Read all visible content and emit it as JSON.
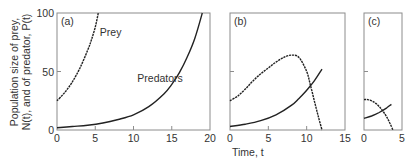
{
  "chart_data": {
    "type": "line",
    "ylabel_line1": "Population size of prey,",
    "ylabel_line2": "N(t), and of predator, P(t)",
    "xlabel": "Time, t",
    "ylim": [
      0,
      100
    ],
    "yticks": [
      0,
      50,
      100
    ],
    "panels": [
      {
        "label": "(a)",
        "xlim": [
          0,
          20
        ],
        "xticks": [
          0,
          5,
          10,
          15,
          20
        ],
        "annotations": [
          {
            "text": "Prey",
            "x": 5.6,
            "y": 80
          },
          {
            "text": "Predators",
            "x": 10.5,
            "y": 41
          }
        ],
        "series": [
          {
            "name": "Prey",
            "style": "dashed",
            "x": [
              0,
              1,
              2,
              3,
              4,
              4.5,
              5,
              5.4
            ],
            "y": [
              25,
              32,
              41,
              53,
              68,
              77,
              88,
              100
            ]
          },
          {
            "name": "Predators",
            "style": "solid",
            "x": [
              0,
              2,
              4,
              6,
              8,
              10,
              12,
              14,
              15,
              16,
              17,
              18,
              19
            ],
            "y": [
              2,
              3,
              4,
              6,
              9,
              13,
              20,
              31,
              39,
              49,
              62,
              78,
              100
            ]
          }
        ]
      },
      {
        "label": "(b)",
        "xlim": [
          0,
          15
        ],
        "xticks": [
          0,
          5,
          10,
          15
        ],
        "series": [
          {
            "name": "Prey",
            "style": "dashed",
            "x": [
              0,
              1,
              2,
              3,
              4,
              5,
              6,
              7,
              8,
              9,
              10,
              10.5,
              11,
              11.5,
              12
            ],
            "y": [
              25,
              29,
              35,
              42,
              48,
              53,
              58,
              62,
              64,
              62,
              50,
              38,
              25,
              12,
              0
            ]
          },
          {
            "name": "Predators",
            "style": "solid",
            "x": [
              0,
              2,
              4,
              6,
              8,
              9,
              10,
              11,
              12
            ],
            "y": [
              3,
              5,
              8,
              13,
              21,
              27,
              34,
              42,
              52
            ]
          }
        ]
      },
      {
        "label": "(c)",
        "xlim": [
          0,
          5
        ],
        "xticks": [
          0,
          5
        ],
        "series": [
          {
            "name": "Prey",
            "style": "dashed",
            "x": [
              0,
              0.5,
              1,
              1.5,
              2,
              2.5,
              3,
              3.4,
              3.8
            ],
            "y": [
              26,
              26,
              25,
              23,
              20,
              16,
              11,
              6,
              0
            ]
          },
          {
            "name": "Predators",
            "style": "solid",
            "x": [
              0,
              1,
              2,
              3,
              3.6
            ],
            "y": [
              10,
              12,
              15,
              19,
              22
            ]
          }
        ]
      }
    ]
  }
}
